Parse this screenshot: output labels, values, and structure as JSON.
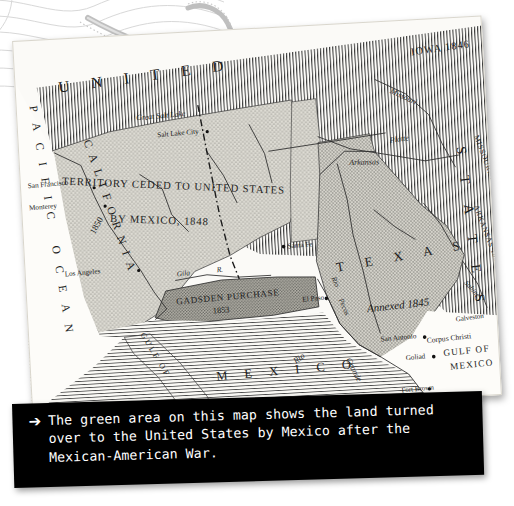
{
  "page": {
    "kind": "photographed-historical-map-with-caption",
    "background_color": "#ffffff"
  },
  "caption": {
    "bullet_icon": "arrow-bullet-icon",
    "bullet_glyph": "➔",
    "text": "The green area on this map shows the land turned\nover to the United States by Mexico after the\nMexican-American War.",
    "background_color": "#000000",
    "text_color": "#ffffff"
  },
  "map": {
    "title_banner": "U N I T E D",
    "title_banner_right": "S T A T E S",
    "paper_color": "#fbfaf7",
    "cession_fill": "#cfcec6",
    "texas_fill": "#c4c3ba",
    "gadsden_fill": "#a9a8a0",
    "territory_labels": [
      {
        "name": "territory-ceded-line1",
        "text": "TERRITORY CEDED TO UNITED STATES"
      },
      {
        "name": "territory-ceded-line2",
        "text": "BY MEXICO,  1848"
      },
      {
        "name": "gadsden-purchase-label",
        "text": "GADSDEN PURCHASE"
      },
      {
        "name": "gadsden-purchase-year",
        "text": "1853"
      },
      {
        "name": "texas-label",
        "text": "T  E  X  A  S"
      },
      {
        "name": "texas-annexed-label",
        "text": "Annexed  1845"
      },
      {
        "name": "mexico-label",
        "text": "M  E  X  I  C  O"
      }
    ],
    "state_labels": [
      {
        "name": "iowa-label",
        "text": "IOWA 1846"
      },
      {
        "name": "missouri-label",
        "text": "MISSOURI 1821"
      },
      {
        "name": "arkansas-label",
        "text": "ARKANSAS 1836"
      },
      {
        "name": "california-label",
        "text": "CALIFORNIA"
      },
      {
        "name": "california-year",
        "text": "1850"
      }
    ],
    "ocean_labels": [
      {
        "name": "pacific-ocean-label",
        "text": "PACIFIC OCEAN"
      },
      {
        "name": "gulf-of-mexico-line1",
        "text": "GULF  OF"
      },
      {
        "name": "gulf-of-mexico-line2",
        "text": "MEXICO"
      }
    ],
    "cities": [
      {
        "name": "city-salt-lake-city",
        "text": "Salt Lake City"
      },
      {
        "name": "city-san-francisco",
        "text": "San Francisco"
      },
      {
        "name": "city-monterey",
        "text": "Monterey"
      },
      {
        "name": "city-los-angeles",
        "text": "Los Angeles"
      },
      {
        "name": "city-santa-fe",
        "text": "Santa Fe"
      },
      {
        "name": "city-el-paso",
        "text": "El Paso"
      },
      {
        "name": "city-san-antonio",
        "text": "San Antonio"
      },
      {
        "name": "city-goliad",
        "text": "Goliad"
      },
      {
        "name": "city-corpus-christi",
        "text": "Corpus Christi"
      },
      {
        "name": "city-galveston",
        "text": "Galveston"
      },
      {
        "name": "city-fort-brown",
        "text": "Fort Brown"
      }
    ],
    "water_features": [
      {
        "name": "great-salt-lake-label",
        "text": "Great Salt Lake"
      },
      {
        "name": "gila-river-label",
        "text": "Gila"
      },
      {
        "name": "gila-river-abbrev",
        "text": "R."
      },
      {
        "name": "rio-grande-label-1",
        "text": "Rio"
      },
      {
        "name": "rio-grande-label-2",
        "text": "Grande"
      },
      {
        "name": "rio-pecos-label-1",
        "text": "Rio"
      },
      {
        "name": "rio-pecos-label-2",
        "text": "Pecos"
      },
      {
        "name": "arkansas-river-label",
        "text": "Arkansas"
      },
      {
        "name": "missouri-river-label",
        "text": "Missouri"
      },
      {
        "name": "platte-river-label",
        "text": "Platte"
      },
      {
        "name": "sabine-river-label",
        "text": "Sabine"
      },
      {
        "name": "gulf-of-california-label",
        "text": "GULF  OF"
      }
    ]
  }
}
